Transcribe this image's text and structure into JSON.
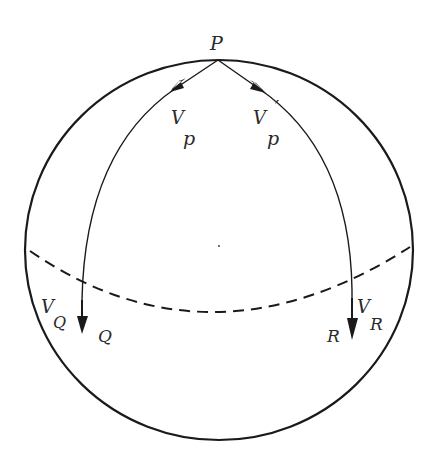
{
  "diagram": {
    "type": "sphere-parallel-transport",
    "colors": {
      "stroke": "#1a1a1a",
      "label": "#2a2a2a",
      "background": "#ffffff"
    },
    "points": {
      "P": {
        "label": "P"
      },
      "Q": {
        "label": "Q"
      },
      "R": {
        "label": "R"
      }
    },
    "vectors": {
      "Vp": {
        "main": "V",
        "sub": "p"
      },
      "Vp_prime": {
        "main": "V",
        "sub": "p",
        "prime": "′"
      },
      "VQ": {
        "main": "V",
        "sub": "Q"
      },
      "VR": {
        "main": "V",
        "sub": "R"
      }
    },
    "elements": [
      "sphere-outline",
      "meridian-PQ",
      "meridian-PR",
      "equator-dashed"
    ]
  }
}
